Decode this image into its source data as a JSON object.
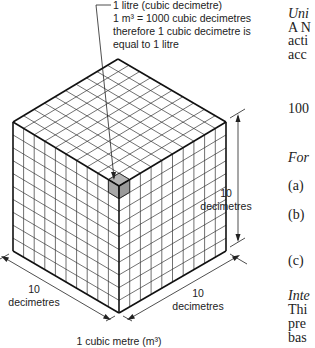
{
  "diagram": {
    "title_caption": "1 cubic metre (m³)",
    "annotation": {
      "lines": [
        "1 litre (cubic decimetre)",
        "1 m³ = 1000 cubic decimetres",
        "therefore 1 cubic decimetre is",
        "equal to 1 litre"
      ]
    },
    "dimensions": {
      "height": {
        "value": "10",
        "unit": "decimetres"
      },
      "left_depth": {
        "value": "10",
        "unit": "decimetres"
      },
      "right_width": {
        "value": "10",
        "unit": "decimetres"
      }
    },
    "cube": {
      "divisions": 10,
      "vertices": {
        "top": [
          118,
          59
        ],
        "left": [
          13,
          122
        ],
        "right": [
          226,
          122
        ],
        "center": [
          119,
          186
        ],
        "bottom_left": [
          13,
          251
        ],
        "bottom_right": [
          226,
          251
        ],
        "bottom": [
          119,
          313
        ]
      },
      "highlight_color": "#a8a8a8",
      "line_color": "#222222"
    }
  },
  "side_text": {
    "lines": [
      {
        "text": "Uni",
        "style": "italic",
        "y": 18
      },
      {
        "text": "A N",
        "style": "normal",
        "y": 32
      },
      {
        "text": "acti",
        "style": "normal",
        "y": 45
      },
      {
        "text": "acc",
        "style": "normal",
        "y": 59
      },
      {
        "text": "100",
        "style": "normal",
        "y": 113
      },
      {
        "text": "For",
        "style": "italic",
        "y": 162
      },
      {
        "text": "(a)",
        "style": "normal",
        "y": 190
      },
      {
        "text": "(b)",
        "style": "normal",
        "y": 219
      },
      {
        "text": "(c)",
        "style": "normal",
        "y": 265
      },
      {
        "text": "Inte",
        "style": "italic",
        "y": 300
      },
      {
        "text": "Thi",
        "style": "normal",
        "y": 314
      },
      {
        "text": "pre",
        "style": "normal",
        "y": 328
      },
      {
        "text": "bas",
        "style": "normal",
        "y": 342
      }
    ]
  }
}
